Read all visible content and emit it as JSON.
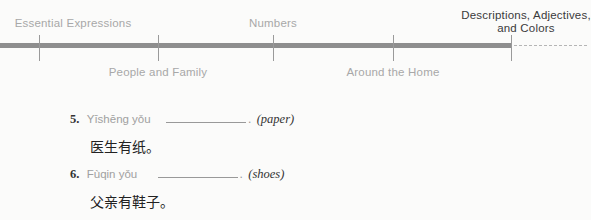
{
  "timeline": {
    "top_labels": [
      {
        "label": "Essential Expressions",
        "x": 73
      },
      {
        "label": "Numbers",
        "x": 273
      }
    ],
    "bottom_labels": [
      {
        "label": "People and Family",
        "x": 158
      },
      {
        "label": "Around the Home",
        "x": 393
      }
    ],
    "active": {
      "line1": "Descriptions, Adjectives,",
      "line2": "and Colors"
    },
    "ticks": [
      39,
      158,
      273,
      393,
      511
    ]
  },
  "exercises": [
    {
      "number": "5.",
      "pinyin": "Yīshēng yǒu",
      "hint": "(paper)",
      "chinese": "医生有纸。"
    },
    {
      "number": "6.",
      "pinyin": "Fùqin yǒu",
      "hint": "(shoes)",
      "chinese": "父亲有鞋子。"
    }
  ]
}
